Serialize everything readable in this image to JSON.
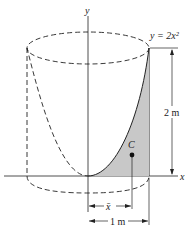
{
  "figure": {
    "curve_label": "y = 2x²",
    "y_axis_label": "y",
    "x_axis_label": "x",
    "height_dim_label": "2 m",
    "width_dim_label": "1 m",
    "centroid_label": "C",
    "xbar_label": "x̄",
    "shade_color": "#c8c8c8",
    "line_color": "#222222"
  }
}
